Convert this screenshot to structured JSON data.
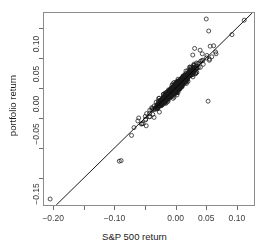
{
  "chart_data": {
    "type": "scatter",
    "title": "",
    "xlabel": "S&P 500 return",
    "ylabel": "portfolio return",
    "xlim": [
      -0.215,
      0.128
    ],
    "ylim": [
      -0.195,
      0.125
    ],
    "grid": false,
    "legend": null,
    "xticks": [
      -0.2,
      -0.15,
      -0.1,
      -0.05,
      0.0,
      0.05,
      0.1
    ],
    "xticklabels": [
      "-0.20",
      "",
      "-0.10",
      "",
      "0.00",
      "0.05",
      "0.10"
    ],
    "yticks": [
      -0.15,
      -0.1,
      -0.05,
      0.0,
      0.05,
      0.1
    ],
    "yticklabels": [
      "-0.15",
      "",
      "-0.05",
      "0.00",
      "0.05",
      "0.10"
    ],
    "reference_line": {
      "kind": "identity",
      "slope": 1,
      "intercept": 0,
      "label": "y = x",
      "color": "#000000"
    },
    "marker": {
      "shape": "open-circle",
      "radius_px": 2.0,
      "color": "#1a1a1a",
      "fill": "none"
    },
    "point_count": 1680,
    "cluster": {
      "center": [
        0.0004,
        0.0002
      ],
      "sd_x": 0.0115,
      "sd_y": 0.0118,
      "correlation": 0.972
    },
    "notable_points": [
      [
        -0.205,
        -0.185
      ],
      [
        -0.092,
        -0.122
      ],
      [
        -0.089,
        -0.121
      ],
      [
        -0.072,
        -0.079
      ],
      [
        -0.068,
        -0.066
      ],
      [
        -0.056,
        -0.06
      ],
      [
        -0.048,
        -0.063
      ],
      [
        -0.043,
        -0.048
      ],
      [
        -0.038,
        -0.034
      ],
      [
        0.023,
        0.035
      ],
      [
        0.028,
        0.055
      ],
      [
        0.031,
        0.066
      ],
      [
        0.04,
        0.063
      ],
      [
        0.05,
        0.115
      ],
      [
        0.054,
        0.095
      ],
      [
        0.053,
        -0.022
      ],
      [
        0.059,
        0.052
      ],
      [
        0.066,
        0.057
      ],
      [
        0.092,
        0.089
      ],
      [
        0.112,
        0.113
      ]
    ]
  },
  "axes": {
    "x_title": "S&P 500 return",
    "y_title": "portfolio return"
  },
  "colors": {
    "background": "#ffffff",
    "frame": "#8c8c8c",
    "text": "#1a1a1a",
    "tick_text": "#3b3b3b",
    "point": "#1a1a1a",
    "line": "#000000"
  }
}
